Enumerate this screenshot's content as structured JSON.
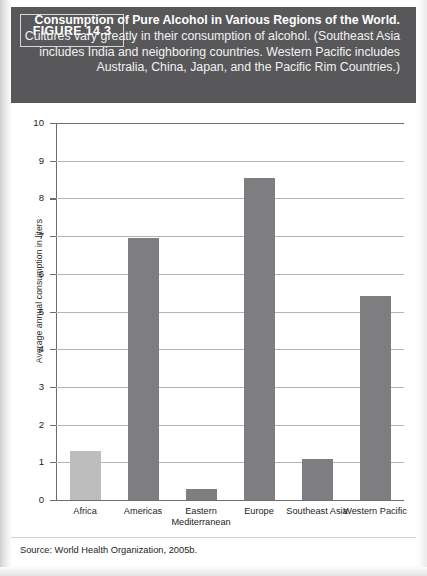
{
  "figure": {
    "number_label": "FIGURE 14.3",
    "title": "Consumption of Pure Alcohol in Various Regions of the World.",
    "description": " Cultures vary greatly in their consumption of alcohol. (Southeast Asia includes India and neighboring countries. Western Pacific includes Australia, China, Japan, and the Pacific Rim Countries.)",
    "source": "Source: World Health Organization, 2005b.",
    "banner_color": "#58585a"
  },
  "chart_data": {
    "type": "bar",
    "title": "Consumption of Pure Alcohol in Various Regions of the World",
    "categories": [
      "Africa",
      "Americas",
      "Eastern Mediterranean",
      "Europe",
      "Southeast Asia",
      "Western Pacific"
    ],
    "values": [
      1.3,
      6.95,
      0.3,
      8.55,
      1.1,
      5.4
    ],
    "xlabel": "",
    "ylabel": "Average annual consumption in liters",
    "ylim": [
      0,
      10
    ],
    "ytick_labels": [
      "10",
      "9",
      "8",
      "7",
      "6",
      "5",
      "4",
      "3",
      "2",
      "1",
      "0"
    ],
    "yticks": [
      10,
      9,
      8,
      7,
      6,
      5,
      4,
      3,
      2,
      1,
      0
    ],
    "grid": true,
    "legend": "none",
    "bar_color": "#7e7e80",
    "highlight_bar_color": "#bdbdbd",
    "highlight_category": "Africa"
  }
}
